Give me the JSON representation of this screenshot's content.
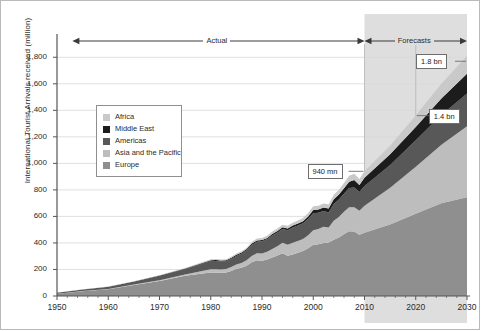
{
  "chart_data": {
    "type": "area",
    "stacked": true,
    "title": "",
    "xlabel": "",
    "ylabel": "International Tourist Arrivals received (million)",
    "xlim": [
      1950,
      2030
    ],
    "ylim": [
      0,
      1900
    ],
    "yticks": [
      "0",
      "200",
      "400",
      "600",
      "800",
      "1,000",
      "1,200",
      "1,400",
      "1,600",
      "1,800"
    ],
    "ytick_values": [
      0,
      200,
      400,
      600,
      800,
      1000,
      1200,
      1400,
      1600,
      1800
    ],
    "xticks": [
      "1950",
      "1960",
      "1970",
      "1980",
      "1990",
      "2000",
      "2010",
      "2020",
      "2030"
    ],
    "xtick_values": [
      1950,
      1960,
      1970,
      1980,
      1990,
      2000,
      2010,
      2020,
      2030
    ],
    "grid": true,
    "legend_position": "inside-left",
    "stack_order_bottom_to_top": [
      "Europe",
      "Asia and the Pacific",
      "Americas",
      "Middle East",
      "Africa"
    ],
    "x": [
      1950,
      1955,
      1960,
      1965,
      1970,
      1975,
      1980,
      1981,
      1982,
      1983,
      1984,
      1985,
      1986,
      1987,
      1988,
      1989,
      1990,
      1991,
      1992,
      1993,
      1994,
      1995,
      1996,
      1997,
      1998,
      1999,
      2000,
      2001,
      2002,
      2003,
      2004,
      2005,
      2006,
      2007,
      2008,
      2009,
      2010,
      2015,
      2020,
      2025,
      2030
    ],
    "series": [
      {
        "name": "Europe",
        "color": "#8f8f8f",
        "values": [
          16.8,
          36,
          50.4,
          82,
          113,
          153,
          178,
          178,
          175,
          177,
          188,
          205,
          213,
          228,
          255,
          270,
          265,
          276,
          291,
          305,
          322,
          304,
          313,
          326,
          340,
          360,
          386,
          390,
          399,
          404,
          424,
          441,
          468,
          488,
          486,
          462,
          476,
          540,
          620,
          700,
          744
        ]
      },
      {
        "name": "Asia and the Pacific",
        "color": "#bdbdbd",
        "values": [
          0.2,
          1,
          2.9,
          4,
          6,
          10,
          23,
          24,
          25,
          27,
          30,
          32,
          36,
          41,
          47,
          52,
          56,
          58,
          64,
          71,
          79,
          82,
          89,
          89,
          89,
          98,
          110,
          115,
          124,
          113,
          144,
          154,
          167,
          182,
          184,
          181,
          204,
          277,
          355,
          440,
          535
        ]
      },
      {
        "name": "Americas",
        "color": "#585858",
        "values": [
          7.5,
          12,
          16.7,
          23,
          33,
          41,
          62,
          62,
          60,
          58,
          62,
          65,
          71,
          76,
          83,
          87,
          92,
          95,
          102,
          102,
          105,
          109,
          114,
          116,
          119,
          122,
          128,
          122,
          117,
          113,
          126,
          133,
          136,
          144,
          148,
          141,
          150,
          170,
          199,
          225,
          248
        ]
      },
      {
        "name": "Middle East",
        "color": "#1c1c1c",
        "values": [
          0.2,
          0.6,
          0.6,
          1,
          2,
          3,
          7,
          7,
          7,
          7,
          8,
          9,
          8,
          9,
          10,
          10,
          10,
          9,
          11,
          12,
          13,
          14,
          15,
          15,
          16,
          19,
          25,
          25,
          28,
          30,
          36,
          37,
          41,
          47,
          56,
          53,
          61,
          82,
          101,
          125,
          149
        ]
      },
      {
        "name": "Africa",
        "color": "#c9c9c9",
        "values": [
          0.5,
          0.8,
          0.8,
          1.4,
          2.4,
          4.7,
          7.2,
          7.4,
          7.3,
          7.5,
          8.3,
          9.4,
          9.3,
          9.8,
          12.4,
          13.8,
          15,
          16,
          18,
          18,
          19,
          20,
          22,
          23,
          25,
          27,
          28,
          29,
          30,
          31,
          34,
          37,
          40,
          45,
          47,
          46,
          50,
          64,
          85,
          110,
          134
        ]
      }
    ],
    "annotations": [
      {
        "name": "actual-span",
        "label": "Actual",
        "x_from": 1953,
        "x_to": 2010,
        "style": "double-arrow"
      },
      {
        "name": "forecast-span",
        "label": "Forecasts",
        "x_from": 2010,
        "x_to": 2030,
        "style": "double-arrow"
      },
      {
        "name": "callout-940",
        "label": "940 mn",
        "x": 2010,
        "y": 940
      },
      {
        "name": "callout-1400",
        "label": "1.4 bn",
        "x": 2020,
        "y": 1360
      },
      {
        "name": "callout-1800",
        "label": "1.8 bn",
        "x": 2030,
        "y": 1770
      }
    ],
    "forecast_shading": {
      "from": 2010,
      "to": 2030,
      "color": "#dedede"
    }
  },
  "legend": {
    "items": [
      {
        "label": "Africa",
        "color": "#c9c9c9"
      },
      {
        "label": "Middle East",
        "color": "#1c1c1c"
      },
      {
        "label": "Americas",
        "color": "#585858"
      },
      {
        "label": "Asia and the Pacific",
        "color": "#bdbdbd"
      },
      {
        "label": "Europe",
        "color": "#8f8f8f"
      }
    ]
  },
  "colors": {
    "axis": "#555555",
    "grid": "#d8d8d8",
    "text": "#2b2b2b",
    "forecast_band": "#dedede",
    "callout_border": "#6d6d6d",
    "frame": "#b9b9b9"
  }
}
